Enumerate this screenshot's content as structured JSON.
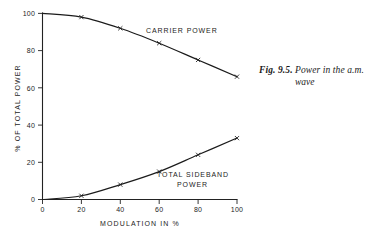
{
  "caption": {
    "figure_number": "Fig. 9.5.",
    "line1": "Power in the a.m.",
    "line2": "wave"
  },
  "chart_data": {
    "type": "line",
    "title": "",
    "xlabel": "MODULATION IN %",
    "ylabel": "% OF TOTAL POWER",
    "x": [
      0,
      20,
      40,
      60,
      80,
      100
    ],
    "xlim": [
      0,
      100
    ],
    "ylim": [
      0,
      100
    ],
    "xticks": [
      "0",
      "20",
      "40",
      "60",
      "80",
      "100"
    ],
    "yticks": [
      "0",
      "20",
      "40",
      "60",
      "80",
      "100"
    ],
    "grid": false,
    "legend_position": "inline-annotation",
    "marker": "x",
    "series": [
      {
        "name": "CARRIER POWER",
        "label_line1": "CARRIER POWER",
        "label_line2": "",
        "values": [
          100,
          98,
          92,
          84,
          75,
          66
        ]
      },
      {
        "name": "TOTAL SIDEBAND POWER",
        "label_line1": "TOTAL SIDEBAND",
        "label_line2": "POWER",
        "values": [
          0,
          2,
          8,
          15,
          24,
          33
        ]
      }
    ]
  },
  "colors": {
    "ink": "#1b1b1b",
    "background": "#ffffff"
  }
}
